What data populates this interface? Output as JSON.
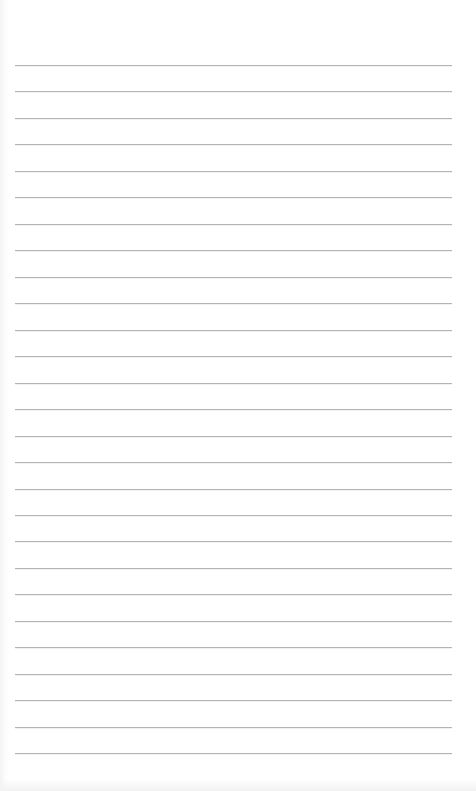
{
  "document": {
    "type": "lined-paper",
    "background_color": "#ffffff",
    "rule_color": "#b4b4b4",
    "rules": {
      "count": 27,
      "first_y": 65,
      "spacing": 26.47,
      "left": 15,
      "right": 452
    },
    "text_content": []
  }
}
